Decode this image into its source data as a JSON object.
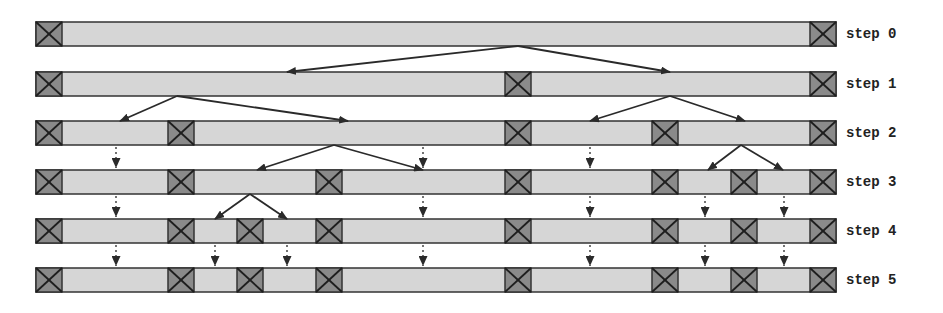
{
  "title": "",
  "colors": {
    "segment_fill": "#d6d6d6",
    "segment_fill_light": "#dcdcdc",
    "pivot_fill": "#8a8a8a",
    "stroke": "#333333",
    "arrow": "#2a2a2a"
  },
  "layout": {
    "bar_left": 36,
    "bar_right": 836,
    "bar_height": 24,
    "box_width": 26,
    "row_tops": [
      22,
      72,
      121,
      170,
      219,
      268
    ]
  },
  "steps": [
    {
      "label": "step 0",
      "boxes": [
        36,
        810
      ]
    },
    {
      "label": "step 1",
      "boxes": [
        36,
        505,
        810
      ]
    },
    {
      "label": "step 2",
      "boxes": [
        36,
        168,
        505,
        652,
        810
      ]
    },
    {
      "label": "step 3",
      "boxes": [
        36,
        168,
        316,
        505,
        652,
        731,
        810
      ]
    },
    {
      "label": "step 4",
      "boxes": [
        36,
        168,
        237,
        316,
        505,
        652,
        731,
        810
      ]
    },
    {
      "label": "step 5",
      "boxes": [
        36,
        168,
        237,
        316,
        505,
        652,
        731,
        810
      ]
    }
  ],
  "split_arrows": [
    {
      "from_step": 0,
      "from_x": 518,
      "to": [
        287,
        670
      ]
    },
    {
      "from_step": 1,
      "from_x": 177,
      "to": [
        120,
        348
      ]
    },
    {
      "from_step": 1,
      "from_x": 670,
      "to": [
        590,
        745
      ]
    },
    {
      "from_step": 2,
      "from_x": 334,
      "to": [
        257,
        423
      ]
    },
    {
      "from_step": 2,
      "from_x": 741,
      "to": [
        708,
        783
      ]
    },
    {
      "from_step": 3,
      "from_x": 250,
      "to": [
        215,
        287
      ]
    }
  ],
  "carry_arrows": [
    {
      "from_step": 2,
      "xs": [
        116,
        423,
        590
      ]
    },
    {
      "from_step": 3,
      "xs": [
        116,
        423,
        590,
        705,
        784
      ]
    },
    {
      "from_step": 4,
      "xs": [
        116,
        215,
        287,
        423,
        590,
        705,
        784
      ]
    }
  ]
}
